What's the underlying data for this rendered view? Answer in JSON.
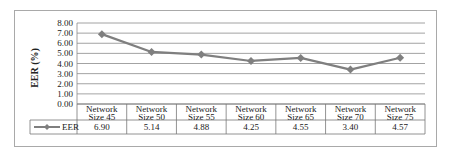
{
  "chart_data": {
    "type": "line",
    "title": "",
    "xlabel": "",
    "ylabel": "EER (%)",
    "ylim": [
      0,
      8
    ],
    "yticks": [
      "0.00",
      "1.00",
      "2.00",
      "3.00",
      "4.00",
      "5.00",
      "6.00",
      "7.00",
      "8.00"
    ],
    "grid": true,
    "categories": [
      "Network Size 45",
      "Network Size 50",
      "Network Size 55",
      "Network Size 60",
      "Network Size 65",
      "Network Size 70",
      "Network Size 75"
    ],
    "category_lines": [
      [
        "Network",
        "Size 45"
      ],
      [
        "Network",
        "Size 50"
      ],
      [
        "Network",
        "Size 55"
      ],
      [
        "Network",
        "Size 60"
      ],
      [
        "Network",
        "Size 65"
      ],
      [
        "Network",
        "Size 70"
      ],
      [
        "Network",
        "Size 75"
      ]
    ],
    "series": [
      {
        "name": "EER",
        "values": [
          6.9,
          5.14,
          4.88,
          4.25,
          4.55,
          3.4,
          4.57
        ],
        "labels": [
          "6.90",
          "5.14",
          "4.88",
          "4.25",
          "4.55",
          "3.40",
          "4.57"
        ],
        "color": "#7f7f7f"
      }
    ],
    "legend_position": "data-table"
  }
}
